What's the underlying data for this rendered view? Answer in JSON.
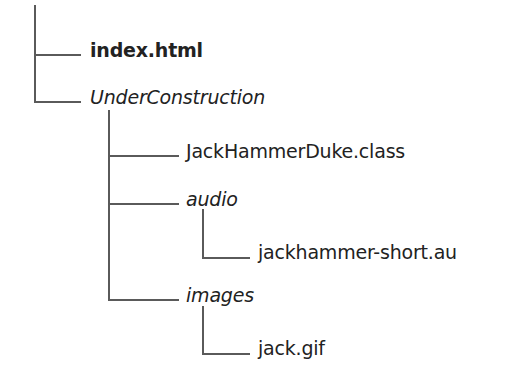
{
  "diagram": {
    "type": "directory-tree",
    "line_color": "#5a5a5a",
    "text_color": "#222222",
    "nodes": [
      {
        "name": "index.html",
        "kind": "file",
        "style": "bold",
        "depth": 1
      },
      {
        "name": "UnderConstruction",
        "kind": "directory",
        "style": "italic",
        "depth": 1
      },
      {
        "name": "JackHammerDuke.class",
        "kind": "file",
        "style": "regular",
        "depth": 2
      },
      {
        "name": "audio",
        "kind": "directory",
        "style": "italic",
        "depth": 2
      },
      {
        "name": "jackhammer-short.au",
        "kind": "file",
        "style": "regular",
        "depth": 3
      },
      {
        "name": "images",
        "kind": "directory",
        "style": "italic",
        "depth": 2
      },
      {
        "name": "jack.gif",
        "kind": "file",
        "style": "regular",
        "depth": 3
      }
    ]
  }
}
